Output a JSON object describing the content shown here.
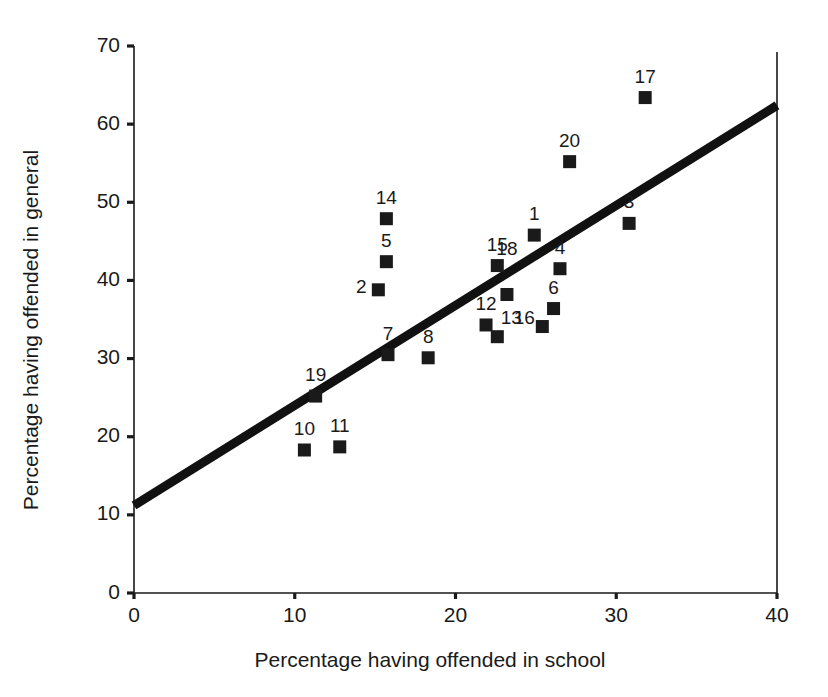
{
  "chart_data": {
    "type": "scatter",
    "title": "",
    "xlabel": "Percentage having offended in school",
    "ylabel": "Percentage having offended in general",
    "xlim": [
      0,
      40
    ],
    "ylim": [
      0,
      70
    ],
    "xticks": [
      0,
      10,
      20,
      30,
      40
    ],
    "yticks": [
      0,
      10,
      20,
      30,
      40,
      50,
      60,
      70
    ],
    "grid": false,
    "legend": "none",
    "marker_style": "filled-square",
    "marker_color": "#1a1a1a",
    "trend_line": {
      "label": "linear fit",
      "color": "#111111",
      "x_start": 0,
      "y_start": 11.2,
      "x_end": 40,
      "y_end": 62.4
    },
    "point_labels": [
      "1",
      "2",
      "3",
      "4",
      "5",
      "6",
      "7",
      "8",
      "10",
      "11",
      "12",
      "13",
      "14",
      "15",
      "16",
      "17",
      "18",
      "19",
      "20"
    ],
    "points": [
      {
        "label": "1",
        "x": 24.9,
        "y": 45.8,
        "label_dx": 0,
        "label_dy": -15,
        "color": "#1a1a1a"
      },
      {
        "label": "2",
        "x": 15.2,
        "y": 38.8,
        "label_dx": -17,
        "label_dy": 3,
        "color": "#1a1a1a"
      },
      {
        "label": "3",
        "x": 30.8,
        "y": 47.3,
        "label_dx": 0,
        "label_dy": -15,
        "color": "#1a1a1a"
      },
      {
        "label": "4",
        "x": 26.5,
        "y": 41.5,
        "label_dx": 0,
        "label_dy": -15,
        "color": "#1a1a1a"
      },
      {
        "label": "5",
        "x": 15.7,
        "y": 42.4,
        "label_dx": 0,
        "label_dy": -15,
        "color": "#1a1a1a"
      },
      {
        "label": "6",
        "x": 26.1,
        "y": 36.4,
        "label_dx": 0,
        "label_dy": -15,
        "color": "#1a1a1a"
      },
      {
        "label": "7",
        "x": 15.8,
        "y": 30.5,
        "label_dx": 0,
        "label_dy": -15,
        "color": "#1a1a1a"
      },
      {
        "label": "8",
        "x": 18.3,
        "y": 30.1,
        "label_dx": 0,
        "label_dy": -15,
        "color": "#1a1a1a"
      },
      {
        "label": "10",
        "x": 10.6,
        "y": 18.3,
        "label_dx": 0,
        "label_dy": -15,
        "color": "#1a1a1a"
      },
      {
        "label": "11",
        "x": 12.8,
        "y": 18.7,
        "label_dx": 0,
        "label_dy": -15,
        "color": "#1a1a1a"
      },
      {
        "label": "12",
        "x": 21.9,
        "y": 34.3,
        "label_dx": 0,
        "label_dy": -15,
        "color": "#1a1a1a"
      },
      {
        "label": "13",
        "x": 22.6,
        "y": 32.8,
        "label_dx": 14,
        "label_dy": -13,
        "color": "#1a1a1a"
      },
      {
        "label": "14",
        "x": 15.7,
        "y": 47.9,
        "label_dx": 0,
        "label_dy": -15,
        "color": "#1a1a1a"
      },
      {
        "label": "15",
        "x": 22.6,
        "y": 41.9,
        "label_dx": 0,
        "label_dy": -15,
        "color": "#1a1a1a"
      },
      {
        "label": "16",
        "x": 25.4,
        "y": 34.1,
        "label_dx": -18,
        "label_dy": -3,
        "color": "#1a1a1a"
      },
      {
        "label": "17",
        "x": 31.8,
        "y": 63.4,
        "label_dx": 0,
        "label_dy": -15,
        "color": "#1a1a1a"
      },
      {
        "label": "18",
        "x": 23.2,
        "y": 38.2,
        "label_dx": 0,
        "label_dy": -39,
        "color": "#4a4a4a"
      },
      {
        "label": "19",
        "x": 11.3,
        "y": 25.2,
        "label_dx": 0,
        "label_dy": -15,
        "color": "#1a1a1a"
      },
      {
        "label": "20",
        "x": 27.1,
        "y": 55.2,
        "label_dx": 0,
        "label_dy": -15,
        "color": "#1a1a1a"
      }
    ]
  },
  "axes": {
    "x_title": "Percentage having offended in school",
    "y_title": "Percentage having offended in general",
    "x_tick_labels": [
      "0",
      "10",
      "20",
      "30",
      "40"
    ],
    "y_tick_labels": [
      "0",
      "10",
      "20",
      "30",
      "40",
      "50",
      "60",
      "70"
    ]
  },
  "geometry": {
    "plot_left": 134,
    "plot_right": 777,
    "plot_top": 46,
    "plot_bottom": 593
  }
}
